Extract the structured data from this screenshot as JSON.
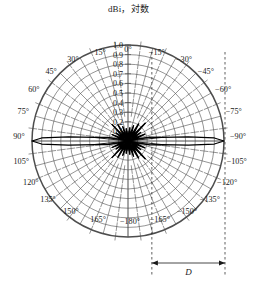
{
  "chart_data": {
    "type": "line",
    "subtype": "polar-radiation-pattern",
    "title": "dBi，対数",
    "radial_axis": {
      "ticks": [
        0.1,
        0.2,
        0.3,
        0.4,
        0.5,
        0.6,
        0.7,
        0.8,
        0.9,
        1.0
      ],
      "tick_labels": [
        "0.1",
        "0.2",
        "0.3",
        "0.4",
        "0.5",
        "0.6",
        "0.7",
        "0.8",
        "0.9",
        "1.0"
      ],
      "min": 0.0,
      "max": 1.0,
      "label_position": "top-vertical-axis"
    },
    "angular_axis": {
      "unit": "degrees",
      "step": 15,
      "grid": true,
      "labels": [
        "0°",
        "15°",
        "30°",
        "45°",
        "60°",
        "75°",
        "90°",
        "105°",
        "120°",
        "135°",
        "150°",
        "165°",
        "−180°",
        "−165°",
        "−150°",
        "−135°",
        "−120°",
        "−105°",
        "−90°",
        "−75°",
        "−60°",
        "−45°",
        "−30°",
        "−15°"
      ]
    },
    "series": [
      {
        "name": "radiation-pattern",
        "description": "narrow horizontal main lobes along ±90° with dense low-level sidelobes",
        "main_lobe_angles_deg": [
          90,
          -90
        ],
        "main_lobe_peak": 1.0,
        "sidelobe_max": 0.32,
        "points": [
          [
            0,
            0.085
          ],
          [
            4,
            0.055
          ],
          [
            8,
            0.13
          ],
          [
            12,
            0.07
          ],
          [
            16,
            0.04
          ],
          [
            20,
            0.16
          ],
          [
            24,
            0.09
          ],
          [
            28,
            0.05
          ],
          [
            32,
            0.2
          ],
          [
            36,
            0.1
          ],
          [
            40,
            0.05
          ],
          [
            44,
            0.24
          ],
          [
            48,
            0.11
          ],
          [
            52,
            0.06
          ],
          [
            56,
            0.15
          ],
          [
            60,
            0.08
          ],
          [
            64,
            0.05
          ],
          [
            68,
            0.18
          ],
          [
            72,
            0.1
          ],
          [
            76,
            0.06
          ],
          [
            80,
            0.22
          ],
          [
            84,
            0.35
          ],
          [
            86,
            0.62
          ],
          [
            88,
            0.9
          ],
          [
            90,
            1.0
          ],
          [
            92,
            0.9
          ],
          [
            94,
            0.62
          ],
          [
            96,
            0.35
          ],
          [
            100,
            0.22
          ],
          [
            104,
            0.06
          ],
          [
            108,
            0.1
          ],
          [
            112,
            0.18
          ],
          [
            116,
            0.05
          ],
          [
            120,
            0.08
          ],
          [
            124,
            0.15
          ],
          [
            128,
            0.06
          ],
          [
            132,
            0.11
          ],
          [
            136,
            0.24
          ],
          [
            140,
            0.05
          ],
          [
            144,
            0.1
          ],
          [
            148,
            0.2
          ],
          [
            152,
            0.05
          ],
          [
            156,
            0.09
          ],
          [
            160,
            0.16
          ],
          [
            164,
            0.04
          ],
          [
            168,
            0.07
          ],
          [
            172,
            0.13
          ],
          [
            176,
            0.055
          ],
          [
            180,
            0.085
          ],
          [
            184,
            0.06
          ],
          [
            188,
            0.14
          ],
          [
            192,
            0.08
          ],
          [
            196,
            0.045
          ],
          [
            200,
            0.17
          ],
          [
            204,
            0.1
          ],
          [
            208,
            0.055
          ],
          [
            212,
            0.21
          ],
          [
            216,
            0.12
          ],
          [
            220,
            0.06
          ],
          [
            224,
            0.26
          ],
          [
            228,
            0.12
          ],
          [
            232,
            0.06
          ],
          [
            236,
            0.16
          ],
          [
            240,
            0.09
          ],
          [
            244,
            0.05
          ],
          [
            248,
            0.19
          ],
          [
            252,
            0.11
          ],
          [
            256,
            0.06
          ],
          [
            260,
            0.23
          ],
          [
            264,
            0.36
          ],
          [
            266,
            0.63
          ],
          [
            268,
            0.9
          ],
          [
            270,
            1.0
          ],
          [
            272,
            0.9
          ],
          [
            274,
            0.63
          ],
          [
            276,
            0.36
          ],
          [
            280,
            0.23
          ],
          [
            284,
            0.06
          ],
          [
            288,
            0.11
          ],
          [
            292,
            0.19
          ],
          [
            296,
            0.05
          ],
          [
            300,
            0.09
          ],
          [
            304,
            0.16
          ],
          [
            308,
            0.06
          ],
          [
            312,
            0.12
          ],
          [
            316,
            0.26
          ],
          [
            320,
            0.06
          ],
          [
            324,
            0.12
          ],
          [
            328,
            0.21
          ],
          [
            332,
            0.055
          ],
          [
            336,
            0.1
          ],
          [
            340,
            0.17
          ],
          [
            344,
            0.045
          ],
          [
            348,
            0.08
          ],
          [
            352,
            0.14
          ],
          [
            356,
            0.06
          ]
        ]
      }
    ],
    "annotations": [
      {
        "name": "aperture-dimension",
        "label": "D",
        "type": "dimension-arrow",
        "from_angle_label": "−15°",
        "to_edge": "plot-right-edge"
      }
    ],
    "colors": {
      "ink": "#1a1a1a",
      "grid": "#4d4d4d",
      "pattern": "#000000",
      "background": "#ffffff"
    }
  }
}
